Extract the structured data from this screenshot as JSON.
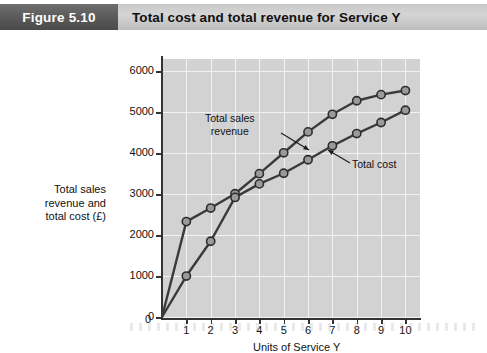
{
  "header": {
    "figure_tag": "Figure 5.10",
    "title": "Total cost and total revenue for Service Y",
    "tag_bg": "#5c5c5c",
    "bar_bg": "#cfcfcf"
  },
  "chart_data": {
    "type": "line",
    "title": "Total cost and total revenue for Service Y",
    "xlabel": "Units of Service Y",
    "ylabel": "Total sales revenue and total cost (£)",
    "x": [
      0,
      1,
      2,
      3,
      4,
      5,
      6,
      7,
      8,
      9,
      10
    ],
    "series": [
      {
        "name": "Total sales revenue",
        "values": [
          0,
          2330,
          2660,
          3010,
          3500,
          4010,
          4520,
          4950,
          5280,
          5430,
          5530
        ],
        "color": "#3a3a3a",
        "marker": "circle"
      },
      {
        "name": "Total cost",
        "values": [
          0,
          1000,
          1850,
          2920,
          3250,
          3510,
          3840,
          4180,
          4480,
          4750,
          5050
        ],
        "color": "#3a3a3a",
        "marker": "circle"
      }
    ],
    "xlim": [
      0,
      10.6
    ],
    "ylim": [
      0,
      6300
    ],
    "xticks": [
      0,
      1,
      2,
      3,
      4,
      5,
      6,
      7,
      8,
      9,
      10
    ],
    "yticks": [
      0,
      1000,
      2000,
      3000,
      4000,
      5000,
      6000
    ],
    "xtick_labels": [
      "0",
      "1",
      "2",
      "3",
      "4",
      "5",
      "6",
      "7",
      "8",
      "9",
      "10"
    ],
    "ytick_labels": [
      "0",
      "1000",
      "2000",
      "3000",
      "4000",
      "5000",
      "6000"
    ],
    "grid": true,
    "grid_color": "#f2f2f2",
    "plot_bg": "#d2d2d2",
    "legend": "none",
    "annotations": [
      {
        "text_line1": "Total sales",
        "text_line2": "revenue",
        "points_to": "Total sales revenue"
      },
      {
        "text_line1": "Total cost",
        "text_line2": "",
        "points_to": "Total cost"
      }
    ]
  },
  "axis": {
    "y_title_line1": "Total sales",
    "y_title_line2": "revenue and",
    "y_title_line3": "total cost (£)",
    "x_title": "Units of Service Y"
  }
}
